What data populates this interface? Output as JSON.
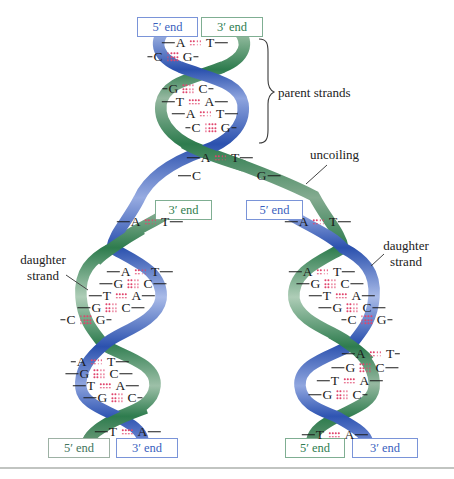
{
  "figure": {
    "title_semantic": "DNA replication: parent strands uncoiling into two daughter helices",
    "background": "#ffffff",
    "bottom_rule_color": "#adb1ad"
  },
  "colors": {
    "blue_strand": "#2b51ae",
    "green_strand": "#2e7c4e",
    "blue_text": "#3a5fbe",
    "blue_border": "#7a94d8",
    "green_text": "#2f7d50",
    "green_border": "#7fae92",
    "muted_green_text": "#42755c",
    "muted_green_border": "#9db1a4",
    "bond_dot": "#e0456d",
    "letter": "#1b1b1b",
    "label": "#222222"
  },
  "labels": {
    "parent_strands": "parent strands",
    "uncoiling": "uncoiling",
    "daughter_left_line1": "daughter",
    "daughter_left_line2": "strand",
    "daughter_right_line1": "daughter",
    "daughter_right_line2": "strand"
  },
  "end_boxes": [
    {
      "id": "top-5prime",
      "text": "5′ end",
      "color": "blue",
      "x": 137,
      "y": 17,
      "w": 61,
      "h": 20
    },
    {
      "id": "top-3prime",
      "text": "3′ end",
      "color": "green",
      "x": 201,
      "y": 17,
      "w": 62,
      "h": 20
    },
    {
      "id": "mid-left-3prime",
      "text": "3′ end",
      "color": "green",
      "x": 155,
      "y": 200,
      "w": 57,
      "h": 20
    },
    {
      "id": "mid-right-5prime",
      "text": "5′ end",
      "color": "blue",
      "x": 246,
      "y": 200,
      "w": 57,
      "h": 20
    },
    {
      "id": "bottom-left-5prime",
      "text": "5′ end",
      "color": "green_muted",
      "x": 48,
      "y": 438,
      "w": 62,
      "h": 20
    },
    {
      "id": "bottom-left-3prime",
      "text": "3′ end",
      "color": "blue",
      "x": 116,
      "y": 438,
      "w": 62,
      "h": 20
    },
    {
      "id": "bottom-right-5prime",
      "text": "5′ end",
      "color": "green",
      "x": 285,
      "y": 438,
      "w": 60,
      "h": 20
    },
    {
      "id": "bottom-right-3prime",
      "text": "3′ end",
      "color": "blue",
      "x": 352,
      "y": 438,
      "w": 66,
      "h": 20
    }
  ],
  "base_pairs": [
    {
      "group": "parent",
      "l": "A",
      "r": "T",
      "b": 2,
      "x": 195,
      "y": 43,
      "ld": "L",
      "rd": "L"
    },
    {
      "group": "parent",
      "l": "C",
      "r": "G",
      "b": 3,
      "x": 173,
      "y": 57,
      "ld": "S",
      "rd": "S"
    },
    {
      "group": "parent",
      "l": "G",
      "r": "C",
      "b": 3,
      "x": 188,
      "y": 89,
      "ld": "S",
      "rd": "S"
    },
    {
      "group": "parent",
      "l": "T",
      "r": "A",
      "b": 2,
      "x": 195,
      "y": 102,
      "ld": "L",
      "rd": "L"
    },
    {
      "group": "parent",
      "l": "A",
      "r": "T",
      "b": 2,
      "x": 205,
      "y": 114,
      "ld": "L",
      "rd": "L"
    },
    {
      "group": "parent",
      "l": "C",
      "r": "G",
      "b": 3,
      "x": 211,
      "y": 128,
      "ld": "S",
      "rd": "S"
    },
    {
      "group": "separating",
      "l": "A",
      "r": "T",
      "b": 2,
      "x": 220,
      "y": 158,
      "ld": "L",
      "rd": "L"
    },
    {
      "group": "separating",
      "l": "C",
      "r": "",
      "b": 0,
      "x": 190,
      "y": 176,
      "ld": "L",
      "rd": "N"
    },
    {
      "group": "separating",
      "l": "",
      "r": "G",
      "b": 0,
      "x": 268,
      "y": 176,
      "ld": "N",
      "rd": "L"
    },
    {
      "group": "left-daughter",
      "l": "A",
      "r": "T",
      "b": 2,
      "x": 150,
      "y": 222,
      "ld": "L",
      "rd": "L"
    },
    {
      "group": "left-daughter",
      "l": "A",
      "r": "T",
      "b": 2,
      "x": 140,
      "y": 272,
      "ld": "L",
      "rd": "L"
    },
    {
      "group": "left-daughter",
      "l": "G",
      "r": "C",
      "b": 3,
      "x": 133,
      "y": 284,
      "ld": "L",
      "rd": "L"
    },
    {
      "group": "left-daughter",
      "l": "T",
      "r": "A",
      "b": 2,
      "x": 122,
      "y": 296,
      "ld": "L",
      "rd": "L"
    },
    {
      "group": "left-daughter",
      "l": "G",
      "r": "C",
      "b": 3,
      "x": 111,
      "y": 308,
      "ld": "L",
      "rd": "L"
    },
    {
      "group": "left-daughter",
      "l": "C",
      "r": "G",
      "b": 3,
      "x": 86,
      "y": 320,
      "ld": "S",
      "rd": "S"
    },
    {
      "group": "left-daughter",
      "l": "A",
      "r": "T",
      "b": 2,
      "x": 100,
      "y": 362,
      "ld": "S",
      "rd": "L"
    },
    {
      "group": "left-daughter",
      "l": "G",
      "r": "C",
      "b": 3,
      "x": 99,
      "y": 374,
      "ld": "L",
      "rd": "L"
    },
    {
      "group": "left-daughter",
      "l": "T",
      "r": "A",
      "b": 2,
      "x": 106,
      "y": 386,
      "ld": "L",
      "rd": "L"
    },
    {
      "group": "left-daughter",
      "l": "G",
      "r": "C",
      "b": 3,
      "x": 113,
      "y": 398,
      "ld": "L",
      "rd": "S"
    },
    {
      "group": "left-daughter",
      "l": "T",
      "r": "A",
      "b": 2,
      "x": 128,
      "y": 432,
      "ld": "L",
      "rd": "L"
    },
    {
      "group": "right-daughter",
      "l": "A",
      "r": "T",
      "b": 2,
      "x": 318,
      "y": 222,
      "ld": "L",
      "rd": "L"
    },
    {
      "group": "right-daughter",
      "l": "A",
      "r": "T",
      "b": 2,
      "x": 322,
      "y": 272,
      "ld": "L",
      "rd": "L"
    },
    {
      "group": "right-daughter",
      "l": "G",
      "r": "C",
      "b": 3,
      "x": 330,
      "y": 284,
      "ld": "L",
      "rd": "L"
    },
    {
      "group": "right-daughter",
      "l": "T",
      "r": "A",
      "b": 2,
      "x": 342,
      "y": 296,
      "ld": "L",
      "rd": "L"
    },
    {
      "group": "right-daughter",
      "l": "G",
      "r": "C",
      "b": 3,
      "x": 352,
      "y": 308,
      "ld": "L",
      "rd": "L"
    },
    {
      "group": "right-daughter",
      "l": "C",
      "r": "G",
      "b": 3,
      "x": 367,
      "y": 320,
      "ld": "S",
      "rd": "S"
    },
    {
      "group": "right-daughter",
      "l": "A",
      "r": "T",
      "b": 2,
      "x": 371,
      "y": 354,
      "ld": "L",
      "rd": "S"
    },
    {
      "group": "right-daughter",
      "l": "G",
      "r": "C",
      "b": 3,
      "x": 365,
      "y": 368,
      "ld": "L",
      "rd": "L"
    },
    {
      "group": "right-daughter",
      "l": "T",
      "r": "A",
      "b": 2,
      "x": 350,
      "y": 381,
      "ld": "L",
      "rd": "L"
    },
    {
      "group": "right-daughter",
      "l": "G",
      "r": "C",
      "b": 3,
      "x": 338,
      "y": 395,
      "ld": "L",
      "rd": "S"
    },
    {
      "group": "right-daughter",
      "l": "T",
      "r": "A",
      "b": 2,
      "x": 335,
      "y": 435,
      "ld": "L",
      "rd": "L"
    }
  ]
}
